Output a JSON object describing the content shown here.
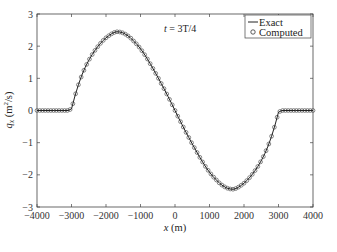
{
  "chart_data": {
    "type": "line",
    "title": "",
    "annotation": "t = 3T/4",
    "xlabel": "x (m)",
    "ylabel": "q_x (m^2/s)",
    "xlim": [
      -4000,
      4000
    ],
    "ylim": [
      -3,
      3
    ],
    "xticks": [
      -4000,
      -3000,
      -2000,
      -1000,
      0,
      1000,
      2000,
      3000,
      4000
    ],
    "yticks": [
      -3,
      -2,
      -1,
      0,
      1,
      2,
      3
    ],
    "grid": false,
    "legend_position": "upper right",
    "legend": [
      "Exact",
      "Computed"
    ],
    "series": [
      {
        "name": "Exact",
        "style": "solid-line",
        "x": [
          -4000,
          -3500,
          -3100,
          -3000,
          -2900,
          -2800,
          -2700,
          -2600,
          -2500,
          -2400,
          -2300,
          -2200,
          -2100,
          -2000,
          -1900,
          -1800,
          -1700,
          -1600,
          -1500,
          -1400,
          -1300,
          -1200,
          -1100,
          -1000,
          -900,
          -800,
          -700,
          -600,
          -500,
          -400,
          -300,
          -200,
          -100,
          0,
          100,
          200,
          300,
          400,
          500,
          600,
          700,
          800,
          900,
          1000,
          1100,
          1200,
          1300,
          1400,
          1500,
          1600,
          1700,
          1800,
          1900,
          2000,
          2100,
          2200,
          2300,
          2400,
          2500,
          2600,
          2700,
          2800,
          2900,
          3000,
          3100,
          3500,
          4000
        ],
        "values": [
          0,
          0,
          0,
          0.05,
          0.45,
          0.8,
          1.1,
          1.35,
          1.56,
          1.74,
          1.9,
          2.04,
          2.16,
          2.26,
          2.34,
          2.41,
          2.45,
          2.44,
          2.41,
          2.35,
          2.27,
          2.16,
          2.05,
          1.92,
          1.77,
          1.6,
          1.42,
          1.23,
          1.04,
          0.84,
          0.64,
          0.43,
          0.22,
          0,
          -0.22,
          -0.43,
          -0.64,
          -0.84,
          -1.04,
          -1.23,
          -1.42,
          -1.6,
          -1.77,
          -1.92,
          -2.05,
          -2.16,
          -2.27,
          -2.35,
          -2.41,
          -2.44,
          -2.45,
          -2.41,
          -2.34,
          -2.26,
          -2.16,
          -2.04,
          -1.9,
          -1.74,
          -1.56,
          -1.35,
          -1.1,
          -0.8,
          -0.45,
          -0.05,
          0,
          0,
          0
        ]
      },
      {
        "name": "Computed",
        "style": "open-circle-markers",
        "marker_spacing_m": 80,
        "note": "Computed values overlay the exact solution"
      }
    ]
  },
  "labels": {
    "annotation_t": "t",
    "annotation_rest": " = 3T/4",
    "xlabel_var": "x",
    "xlabel_unit": " (m)",
    "ylabel_var": "q",
    "ylabel_sub": "x",
    "ylabel_unit_pre": " (m",
    "ylabel_sup": "2",
    "ylabel_unit_post": "/s)",
    "legend_exact": "Exact",
    "legend_computed": "Computed"
  },
  "tick_labels": {
    "x": [
      "−4000",
      "−3000",
      "−2000",
      "−1000",
      "0",
      "1000",
      "2000",
      "3000",
      "4000"
    ],
    "y": [
      "3",
      "2",
      "1",
      "0",
      "−1",
      "−2",
      "−3"
    ]
  }
}
